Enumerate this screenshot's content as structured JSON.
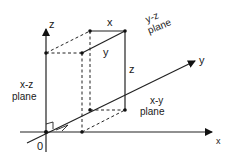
{
  "diagram": {
    "axes": {
      "x_label": "x",
      "y_label": "y",
      "z_label": "z",
      "origin_label": "0"
    },
    "edge_labels": {
      "x": "x",
      "y": "y",
      "z": "z"
    },
    "planes": {
      "xz": {
        "line1": "x-z",
        "line2": "plane"
      },
      "yz": {
        "line1": "y-z",
        "line2": "plane"
      },
      "xy": {
        "line1": "x-y",
        "line2": "plane"
      }
    },
    "colors": {
      "stroke": "#222222",
      "background": "#ffffff"
    }
  }
}
